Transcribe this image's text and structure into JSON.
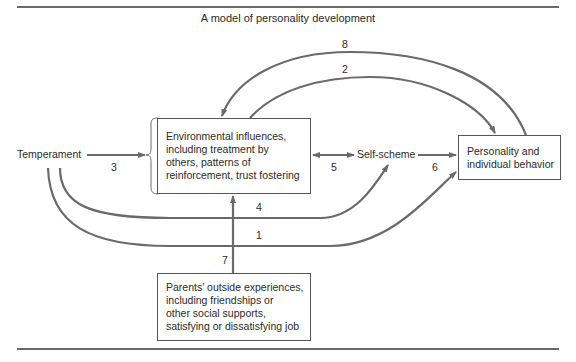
{
  "title": "A model of personality development",
  "nodes": {
    "temperament": "Temperament",
    "environment": "Environmental influences,\nincluding treatment by\nothers, patterns of\nreinforcement, trust fostering",
    "self_scheme": "Self-scheme",
    "personality": "Personality and\nindividual behavior",
    "parents": "Parents' outside experiences,\nincluding friendships or\nother social supports,\nsatisfying or dissatisfying job"
  },
  "edges": [
    {
      "id": 1,
      "label": "1",
      "from": "Temperament",
      "to": "Personality and individual behavior"
    },
    {
      "id": 2,
      "label": "2",
      "from": "Environmental influences",
      "to": "Personality and individual behavior"
    },
    {
      "id": 3,
      "label": "3",
      "from": "Temperament",
      "to": "Environmental influences"
    },
    {
      "id": 4,
      "label": "4",
      "from": "Temperament",
      "to": "Self-scheme"
    },
    {
      "id": 5,
      "label": "5",
      "from": "Environmental influences",
      "to": "Self-scheme",
      "bidirectional": true
    },
    {
      "id": 6,
      "label": "6",
      "from": "Self-scheme",
      "to": "Personality and individual behavior"
    },
    {
      "id": 7,
      "label": "7",
      "from": "Parents' outside experiences",
      "to": "Environmental influences"
    },
    {
      "id": 8,
      "label": "8",
      "from": "Personality and individual behavior",
      "to": "Environmental influences"
    }
  ],
  "colors": {
    "line": "#6a6a6a",
    "text": "#2a2a2a"
  }
}
